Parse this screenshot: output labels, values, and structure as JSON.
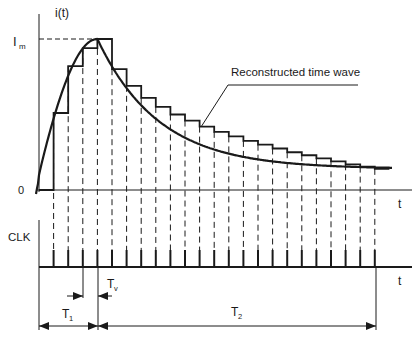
{
  "labels": {
    "y_axis": "i(t)",
    "peak_main": "I",
    "peak_sub": "m",
    "origin": "0",
    "time_axis_top": "t",
    "clk": "CLK",
    "time_axis_bottom": "t",
    "tv_main": "T",
    "tv_sub": "v",
    "t1_main": "T",
    "t1_sub": "1",
    "t2_main": "T",
    "t2_sub": "2",
    "annotation": "Reconstructed time wave"
  },
  "waveform": {
    "description": "Current pulse rising to peak Im then decaying exponentially; staircase approximation sampled at each CLK pulse",
    "rise_samples": 4,
    "decay_samples": 19,
    "total_clk_pulses": 23,
    "rise_levels": [
      0,
      0.51,
      0.82,
      0.94,
      1.0
    ],
    "decay_levels": [
      1.0,
      0.8,
      0.69,
      0.61,
      0.55,
      0.5,
      0.46,
      0.42,
      0.385,
      0.355,
      0.325,
      0.3,
      0.275,
      0.25,
      0.23,
      0.21,
      0.19,
      0.17,
      0.155,
      0.14
    ]
  },
  "colors": {
    "ink": "#1a1a1a",
    "background": "#ffffff"
  }
}
